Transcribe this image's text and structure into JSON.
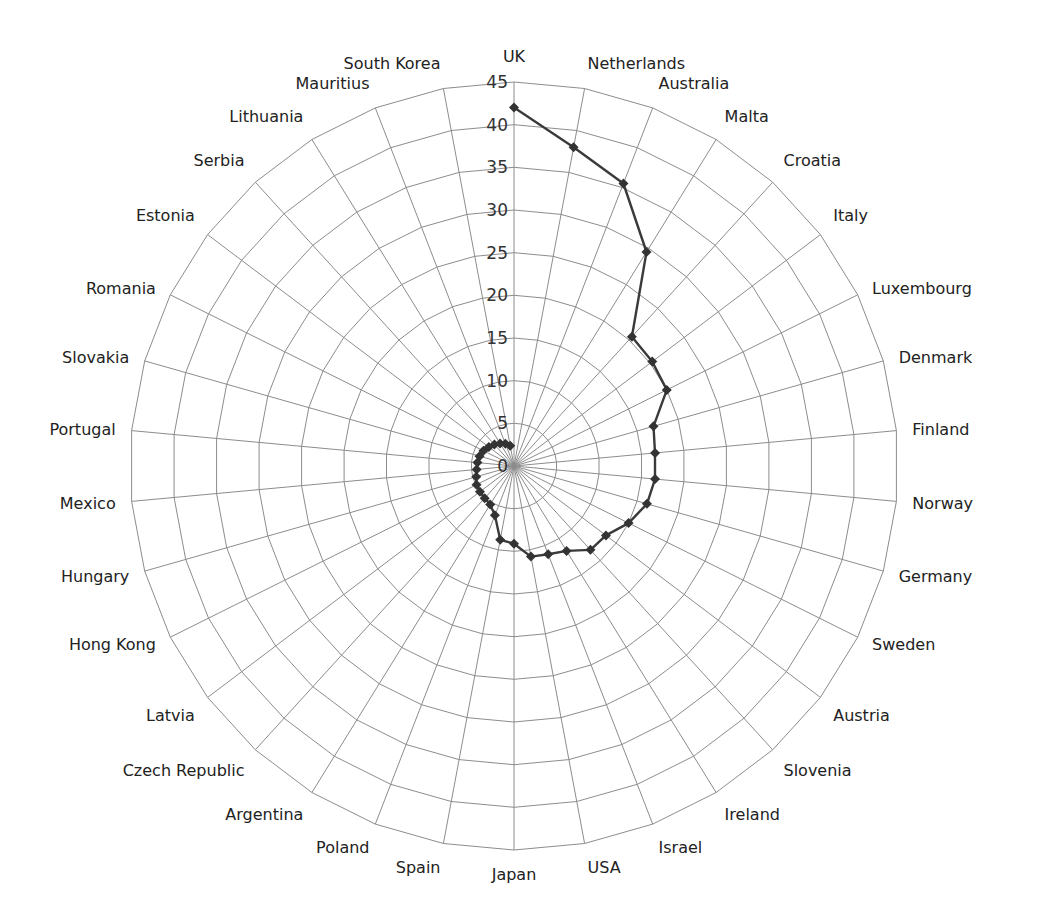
{
  "chart_data": {
    "type": "radar",
    "title": "",
    "categories": [
      "UK",
      "Netherlands",
      "Australia",
      "Malta",
      "Croatia",
      "Italy",
      "Luxembourg",
      "Denmark",
      "Finland",
      "Norway",
      "Germany",
      "Sweden",
      "Austria",
      "Slovenia",
      "Ireland",
      "Israel",
      "USA",
      "Japan",
      "Spain",
      "Poland",
      "Argentina",
      "Czech Republic",
      "Latvia",
      "Hong Kong",
      "Hungary",
      "Mexico",
      "Portugal",
      "Slovakia",
      "Romania",
      "Estonia",
      "Serbia",
      "Lithuania",
      "Mauritius",
      "South Korea"
    ],
    "series": [
      {
        "name": "",
        "values": [
          42,
          38,
          35.5,
          29.5,
          20.5,
          20.3,
          20,
          17,
          16.6,
          16.6,
          16.2,
          15,
          13.5,
          13.3,
          11.7,
          11.1,
          10.8,
          9.1,
          8.8,
          6.2,
          5.3,
          5.1,
          5.0,
          4.9,
          4.6,
          4.4,
          4.3,
          4.2,
          4.0,
          3.7,
          3.4,
          3.1,
          2.8,
          2.4
        ],
        "color": "#3a3a3a",
        "marker": "diamond"
      }
    ],
    "radial_axis": {
      "min": 0,
      "max": 45,
      "step": 5,
      "ticks": [
        "0",
        "5",
        "10",
        "15",
        "20",
        "25",
        "30",
        "35",
        "40",
        "45"
      ]
    },
    "grid": true,
    "grid_shape": "polygon",
    "legend": null,
    "colors": {
      "grid": "#8c8c8c",
      "series": "#3a3a3a",
      "text": "#222222"
    }
  }
}
